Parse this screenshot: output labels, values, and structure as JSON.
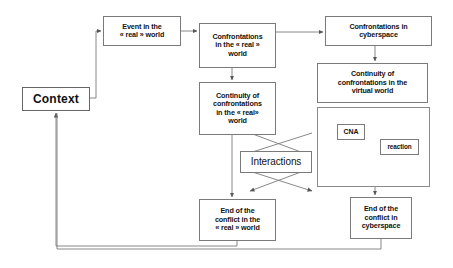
{
  "diagram": {
    "stroke_color": "#7a7a7a",
    "text_color": "#111111",
    "background": "#ffffff",
    "nodes": {
      "context": "Context",
      "event_real": "Event in the\n« real » world",
      "confrontations_real": "Confrontations\nin the « real »\nworld",
      "confrontations_cyber": "Confrontations in\ncyberspace",
      "continuity_real": "Continuity of\nconfrontations\nin the « real»\nworld",
      "continuity_virtual": "Continuity of\nconfrontations in the\nvirtual world",
      "cna": "CNA",
      "reaction": "reaction",
      "interactions": "Interactions",
      "end_real": "End of the\nconflict in the\n« real » world",
      "end_cyber": "End of the\nconflict in\ncyberspace"
    },
    "edges": [
      {
        "from": "context",
        "to": "event_real",
        "style": "orthogonal",
        "arrow": true
      },
      {
        "from": "event_real",
        "to": "confrontations_real",
        "style": "straight",
        "arrow": true
      },
      {
        "from": "confrontations_real",
        "to": "confrontations_cyber",
        "style": "straight",
        "arrow": true
      },
      {
        "from": "confrontations_real",
        "to": "continuity_real",
        "style": "straight",
        "arrow": true
      },
      {
        "from": "confrontations_cyber",
        "to": "continuity_virtual",
        "style": "straight",
        "arrow": true
      },
      {
        "from": "continuity_virtual",
        "to": "cna_group",
        "style": "adjacent",
        "arrow": false
      },
      {
        "from": "continuity_real",
        "to": "end_real",
        "style": "straight",
        "arrow": true
      },
      {
        "from": "cna_group",
        "to": "end_cyber",
        "style": "straight",
        "arrow": true
      },
      {
        "from": "continuity_real",
        "to": "interactions",
        "style": "crossing",
        "arrow": true
      },
      {
        "from": "cna_group",
        "to": "interactions",
        "style": "crossing",
        "arrow": true
      },
      {
        "from": "interactions",
        "to": "end_real",
        "style": "crossing",
        "arrow": true
      },
      {
        "from": "interactions",
        "to": "end_cyber",
        "style": "crossing",
        "arrow": true
      },
      {
        "from": "end_real",
        "to": "context",
        "style": "feedback",
        "arrow": true
      },
      {
        "from": "end_cyber",
        "to": "context",
        "style": "feedback",
        "arrow": true
      }
    ]
  }
}
